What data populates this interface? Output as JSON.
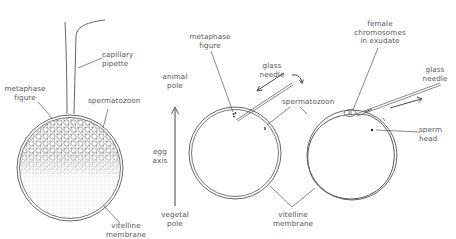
{
  "diagram": {
    "type": "scientific-illustration",
    "colors": {
      "line": "#555555",
      "stipple": "#777777",
      "background": "#ffffff"
    }
  },
  "panel1": {
    "labels": {
      "capillary_pipette": "capillary\npipette",
      "metaphase_figure": "metaphase\nfigure",
      "spermatozoon": "spermatozoon",
      "vitelline_membrane": "vitelline\nmembrane"
    }
  },
  "axis": {
    "animal_pole": "animal\npole",
    "egg_axis": "egg\naxis",
    "vegetal_pole": "vegetal\npole"
  },
  "panel2": {
    "labels": {
      "metaphase_figure": "metaphase\nfigure",
      "glass_needle": "glass\nneedle",
      "spermatozoon": "spermatozoon"
    }
  },
  "panel3": {
    "labels": {
      "female_chromosomes": "female\nchromosomes\nin exudate",
      "glass_needle": "glass\nneedle",
      "sperm_head": "sperm\nhead"
    }
  },
  "shared": {
    "vitelline_membrane": "vitelline\nmembrane"
  }
}
